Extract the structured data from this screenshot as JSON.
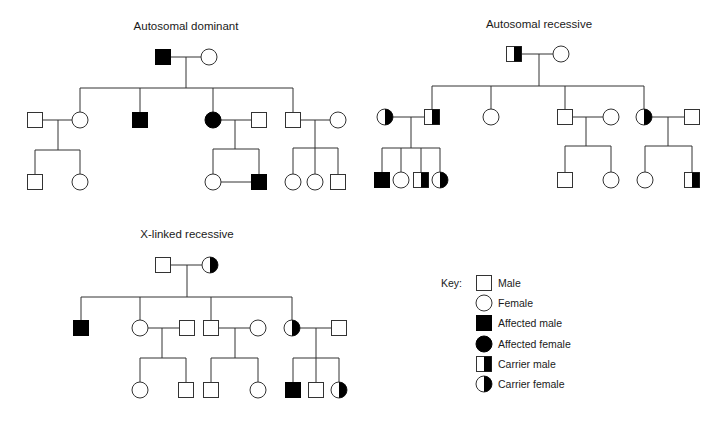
{
  "panels": {
    "dominant": {
      "title": "Autosomal dominant"
    },
    "recessive": {
      "title": "Autosomal recessive"
    },
    "xlinked": {
      "title": "X-linked recessive"
    }
  },
  "key": {
    "label": "Key:",
    "items": [
      {
        "symbol": "male",
        "label": "Male"
      },
      {
        "symbol": "female",
        "label": "Female"
      },
      {
        "symbol": "affected-male",
        "label": "Affected male"
      },
      {
        "symbol": "affected-female",
        "label": "Affected female"
      },
      {
        "symbol": "carrier-male",
        "label": "Carrier male"
      },
      {
        "symbol": "carrier-female",
        "label": "Carrier female"
      }
    ]
  },
  "pedigrees": {
    "dominant": {
      "individuals": [
        {
          "gen": 1,
          "type": "affected-male",
          "x": 163,
          "y": 57
        },
        {
          "gen": 1,
          "type": "female",
          "x": 209,
          "y": 57
        },
        {
          "gen": 2,
          "type": "male",
          "x": 35,
          "y": 120
        },
        {
          "gen": 2,
          "type": "female",
          "x": 80,
          "y": 120
        },
        {
          "gen": 2,
          "type": "affected-male",
          "x": 140,
          "y": 120
        },
        {
          "gen": 2,
          "type": "affected-female",
          "x": 213,
          "y": 120
        },
        {
          "gen": 2,
          "type": "male",
          "x": 259,
          "y": 120
        },
        {
          "gen": 2,
          "type": "male",
          "x": 293,
          "y": 120
        },
        {
          "gen": 2,
          "type": "female",
          "x": 338,
          "y": 120
        },
        {
          "gen": 3,
          "type": "male",
          "x": 35,
          "y": 182
        },
        {
          "gen": 3,
          "type": "female",
          "x": 80,
          "y": 182
        },
        {
          "gen": 3,
          "type": "female",
          "x": 213,
          "y": 182
        },
        {
          "gen": 3,
          "type": "affected-male",
          "x": 259,
          "y": 182
        },
        {
          "gen": 3,
          "type": "female",
          "x": 293,
          "y": 182
        },
        {
          "gen": 3,
          "type": "female",
          "x": 315,
          "y": 182
        },
        {
          "gen": 3,
          "type": "male",
          "x": 338,
          "y": 182
        }
      ]
    },
    "recessive": {
      "individuals": [
        {
          "gen": 1,
          "type": "carrier-male",
          "x": 514,
          "y": 54
        },
        {
          "gen": 1,
          "type": "female",
          "x": 561,
          "y": 54
        },
        {
          "gen": 2,
          "type": "carrier-female",
          "x": 385,
          "y": 117
        },
        {
          "gen": 2,
          "type": "carrier-male",
          "x": 432,
          "y": 117
        },
        {
          "gen": 2,
          "type": "female",
          "x": 491,
          "y": 117
        },
        {
          "gen": 2,
          "type": "male",
          "x": 565,
          "y": 117
        },
        {
          "gen": 2,
          "type": "female",
          "x": 611,
          "y": 117
        },
        {
          "gen": 2,
          "type": "carrier-female",
          "x": 644,
          "y": 117
        },
        {
          "gen": 2,
          "type": "male",
          "x": 692,
          "y": 117
        },
        {
          "gen": 3,
          "type": "affected-male",
          "x": 382,
          "y": 180
        },
        {
          "gen": 3,
          "type": "female",
          "x": 401,
          "y": 180
        },
        {
          "gen": 3,
          "type": "carrier-male",
          "x": 421,
          "y": 180
        },
        {
          "gen": 3,
          "type": "carrier-female",
          "x": 440,
          "y": 180
        },
        {
          "gen": 3,
          "type": "male",
          "x": 565,
          "y": 180
        },
        {
          "gen": 3,
          "type": "female",
          "x": 611,
          "y": 180
        },
        {
          "gen": 3,
          "type": "female",
          "x": 645,
          "y": 180
        },
        {
          "gen": 3,
          "type": "carrier-male",
          "x": 692,
          "y": 180
        }
      ]
    },
    "xlinked": {
      "individuals": [
        {
          "gen": 1,
          "type": "male",
          "x": 163,
          "y": 265
        },
        {
          "gen": 1,
          "type": "carrier-female",
          "x": 210,
          "y": 265
        },
        {
          "gen": 2,
          "type": "affected-male",
          "x": 81,
          "y": 328
        },
        {
          "gen": 2,
          "type": "female",
          "x": 140,
          "y": 328
        },
        {
          "gen": 2,
          "type": "male",
          "x": 187,
          "y": 328
        },
        {
          "gen": 2,
          "type": "male",
          "x": 211,
          "y": 328
        },
        {
          "gen": 2,
          "type": "female",
          "x": 258,
          "y": 328
        },
        {
          "gen": 2,
          "type": "carrier-female",
          "x": 292,
          "y": 328
        },
        {
          "gen": 2,
          "type": "male",
          "x": 339,
          "y": 328
        },
        {
          "gen": 3,
          "type": "female",
          "x": 140,
          "y": 390
        },
        {
          "gen": 3,
          "type": "male",
          "x": 186,
          "y": 390
        },
        {
          "gen": 3,
          "type": "male",
          "x": 211,
          "y": 390
        },
        {
          "gen": 3,
          "type": "female",
          "x": 258,
          "y": 390
        },
        {
          "gen": 3,
          "type": "affected-male",
          "x": 293,
          "y": 390
        },
        {
          "gen": 3,
          "type": "male",
          "x": 316,
          "y": 390
        },
        {
          "gen": 3,
          "type": "carrier-female",
          "x": 339,
          "y": 390
        }
      ]
    }
  }
}
